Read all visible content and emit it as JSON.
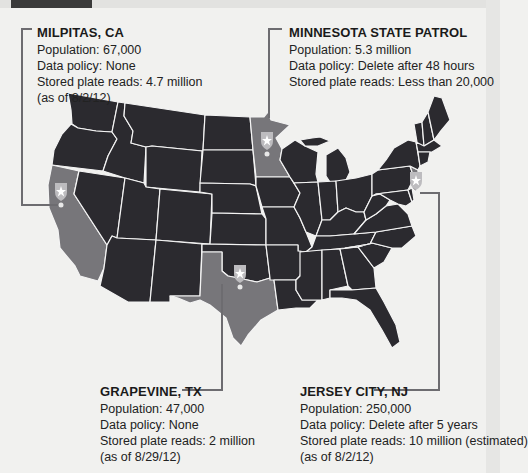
{
  "header": {
    "tab_label": ""
  },
  "map": {
    "title": "License plate reader data by agency",
    "colors": {
      "background": "#f1f1ef",
      "state_default": "#2b2a2f",
      "state_highlight": "#77767a",
      "state_border": "#f4f4f4",
      "leader_line": "#6d6c70",
      "badge": "#bdbcbf",
      "badge_star": "#ffffff"
    },
    "highlighted_states": [
      "CA",
      "MN",
      "TX",
      "NJ"
    ]
  },
  "callouts": [
    {
      "id": "milpitas",
      "title": "MILPITAS, CA",
      "lines": [
        "Population: 67,000",
        "Data policy: None",
        "Stored plate reads: 4.7 million",
        "(as of 8/2/12)"
      ]
    },
    {
      "id": "minnesota",
      "title": "MINNESOTA STATE PATROL",
      "lines": [
        "Population: 5.3 million",
        "Data policy: Delete after 48 hours",
        "Stored plate reads: Less than 20,000"
      ]
    },
    {
      "id": "grapevine",
      "title": "GRAPEVINE, TX",
      "lines": [
        "Population: 47,000",
        "Data policy: None",
        "Stored plate reads: 2 million",
        "(as of 8/29/12)"
      ]
    },
    {
      "id": "jersey",
      "title": "JERSEY CITY, NJ",
      "lines": [
        "Population: 250,000",
        "Data policy: Delete after 5 years",
        "Stored plate reads: 10 million (estimated)",
        "(as of 8/2/12)"
      ]
    }
  ],
  "markers": [
    {
      "name": "milpitas-badge",
      "icon": "sheriff-badge-star-icon",
      "x": 61,
      "y": 193
    },
    {
      "name": "minnesota-badge",
      "icon": "sheriff-badge-star-icon",
      "x": 267,
      "y": 142
    },
    {
      "name": "grapevine-badge",
      "icon": "sheriff-badge-star-icon",
      "x": 240,
      "y": 275
    },
    {
      "name": "jersey-city-badge",
      "icon": "sheriff-badge-star-icon",
      "x": 416,
      "y": 183
    }
  ]
}
